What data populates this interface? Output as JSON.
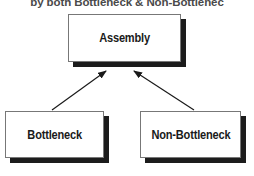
{
  "title": {
    "text": "by both Bottleneck & Non-Bottlenec"
  },
  "diagram": {
    "type": "flowchart",
    "direction": "bottom-up",
    "nodes": [
      {
        "id": "assembly",
        "label": "Assembly"
      },
      {
        "id": "bottleneck",
        "label": "Bottleneck"
      },
      {
        "id": "non-bottleneck",
        "label": "Non-Bottleneck"
      }
    ],
    "edges": [
      {
        "from": "bottleneck",
        "to": "assembly",
        "arrowhead": "filled-triangle"
      },
      {
        "from": "non-bottleneck",
        "to": "assembly",
        "arrowhead": "filled-triangle"
      }
    ],
    "colors": {
      "background": "#ffffff",
      "node_fill": "#ffffff",
      "node_border": "#777777",
      "node_shadow": "#1c1c1c",
      "node_text": "#1a1a1a",
      "title_text": "#4a4a4a",
      "edge": "#1a1a1a"
    }
  }
}
